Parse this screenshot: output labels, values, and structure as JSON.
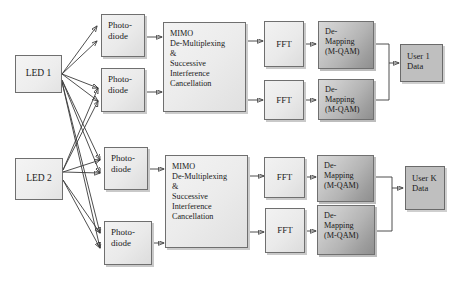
{
  "diagram": {
    "colors": {
      "stroke": "#3a3a3a",
      "box_border": "#6f6f6f",
      "light_fill": "#eaeaea",
      "demap_fill_light": "#d8d8d8",
      "demap_fill_dark": "#8f8f8f",
      "userdata_fill": "#bfbfbf"
    },
    "transmitters": [
      {
        "id": "led-1",
        "label": "LED 1"
      },
      {
        "id": "led-2",
        "label": "LED 2"
      }
    ],
    "photodiodes": [
      {
        "id": "photodiode-1",
        "label": "Photo-\ndiode"
      },
      {
        "id": "photodiode-2",
        "label": "Photo-\ndiode"
      },
      {
        "id": "photodiode-3",
        "label": "Photo-\ndiode"
      },
      {
        "id": "photodiode-4",
        "label": "Photo-\ndiode"
      }
    ],
    "mimo_blocks": [
      {
        "id": "mimo-1",
        "label": "MIMO\nDe-Multiplexing\n&\nSuccessive\nInterference\nCancellation"
      },
      {
        "id": "mimo-2",
        "label": "MIMO\nDe-Multiplexing\n&\nSuccessive\nInterference\nCancellation"
      }
    ],
    "fft_blocks": [
      {
        "id": "fft-1",
        "label": "FFT"
      },
      {
        "id": "fft-2",
        "label": "FFT"
      },
      {
        "id": "fft-3",
        "label": "FFT"
      },
      {
        "id": "fft-4",
        "label": "FFT"
      }
    ],
    "demapping_blocks": [
      {
        "id": "demapping-1",
        "label": "De-\nMapping\n(M-QAM)"
      },
      {
        "id": "demapping-2",
        "label": "De-\nMapping\n(M-QAM)"
      },
      {
        "id": "demapping-3",
        "label": "De-\nMapping\n(M-QAM)"
      },
      {
        "id": "demapping-4",
        "label": "De-\nMapping\n(M-QAM)"
      }
    ],
    "outputs": [
      {
        "id": "user-1-data",
        "label": "User 1\nData"
      },
      {
        "id": "user-k-data",
        "label": "User K\nData"
      }
    ]
  }
}
